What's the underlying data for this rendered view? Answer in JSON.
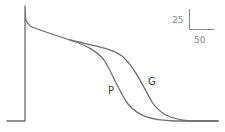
{
  "diagram": {
    "type": "action-potential-comparison",
    "traces": [
      {
        "label": "P",
        "color": "#6e6e6e"
      },
      {
        "label": "G",
        "color": "#6e6e6e"
      }
    ],
    "scale_bar": {
      "vertical_value": "25",
      "horizontal_value": "50",
      "color": "#8a8a8a"
    }
  }
}
